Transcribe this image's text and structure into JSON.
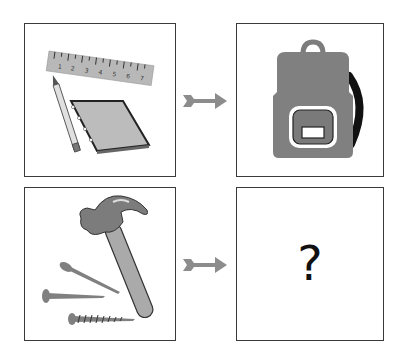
{
  "puzzle": {
    "type": "analogy",
    "panels": [
      {
        "id": "top-left",
        "content": "school supplies: ruler, pencil, notebook"
      },
      {
        "id": "top-right",
        "content": "backpack"
      },
      {
        "id": "bottom-left",
        "content": "hammer and nails/screw"
      },
      {
        "id": "bottom-right",
        "content": "?"
      }
    ],
    "ruler_numbers": [
      "1",
      "2",
      "3",
      "4",
      "5",
      "6",
      "7"
    ],
    "question_mark": "?",
    "colors": {
      "border": "#3a3a3a",
      "gray_fill": "#8a8a8a",
      "light_gray": "#bdbdbd",
      "arrow": "#8c8c8c",
      "dark": "#1a1a1a"
    }
  }
}
